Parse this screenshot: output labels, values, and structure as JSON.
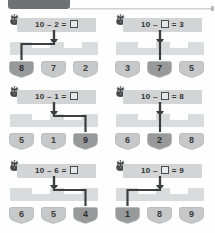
{
  "topbar": {
    "badge_label": "",
    "badge_color": "#6f7174",
    "rule_color": "#c9cbcd"
  },
  "theme": {
    "page_background": "#fefefe",
    "equation_bar": "#d2d4d6",
    "bracket_bar": "#d9dbdd",
    "tile_unselected": "#c6c8ca",
    "tile_selected": "#97999b",
    "tile_stroke": "#b0b2b4",
    "connector": "#3c3e40",
    "text": "#2f3133"
  },
  "worksheet": {
    "mascot_icon": "bird-icon",
    "blank_glyph": "□",
    "minus_glyph": "–",
    "equals_glyph": "=",
    "problems": [
      {
        "id": "problem-1",
        "equation": "10 – 2 = □",
        "left_operand": "10",
        "operator": "–",
        "right_operand": "2",
        "result": "□",
        "blank_side": "result",
        "choices": [
          "8",
          "7",
          "2"
        ],
        "selected_index": 0,
        "selected_value": "8"
      },
      {
        "id": "problem-2",
        "equation": "10 – □ = 3",
        "left_operand": "10",
        "operator": "–",
        "right_operand": "□",
        "result": "3",
        "blank_side": "operand",
        "choices": [
          "3",
          "7",
          "5"
        ],
        "selected_index": 1,
        "selected_value": "7"
      },
      {
        "id": "problem-3",
        "equation": "10 – 1 = □",
        "left_operand": "10",
        "operator": "–",
        "right_operand": "1",
        "result": "□",
        "blank_side": "result",
        "choices": [
          "5",
          "1",
          "9"
        ],
        "selected_index": 2,
        "selected_value": "9"
      },
      {
        "id": "problem-4",
        "equation": "10 – □ = 8",
        "left_operand": "10",
        "operator": "–",
        "right_operand": "□",
        "result": "8",
        "blank_side": "operand",
        "choices": [
          "6",
          "2",
          "8"
        ],
        "selected_index": 1,
        "selected_value": "2"
      },
      {
        "id": "problem-5",
        "equation": "10 – 6 = □",
        "left_operand": "10",
        "operator": "–",
        "right_operand": "6",
        "result": "□",
        "blank_side": "result",
        "choices": [
          "6",
          "5",
          "4"
        ],
        "selected_index": 2,
        "selected_value": "4"
      },
      {
        "id": "problem-6",
        "equation": "10 – □ = 9",
        "left_operand": "10",
        "operator": "–",
        "right_operand": "□",
        "result": "9",
        "blank_side": "operand",
        "choices": [
          "1",
          "8",
          "9"
        ],
        "selected_index": 0,
        "selected_value": "1"
      }
    ]
  }
}
